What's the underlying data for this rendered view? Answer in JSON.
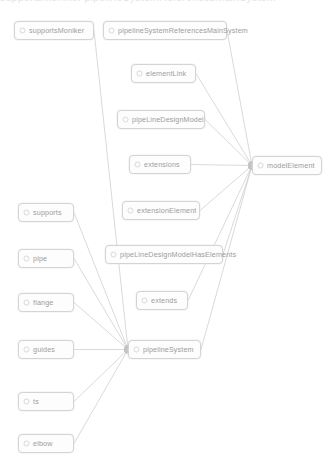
{
  "diagram": {
    "title_partial": "supportsMoniker  pipelineSystemReferencesMainSystem",
    "icon_name": "class-node-icon",
    "edge_color": "#b9b9b9",
    "node_border_color": "#c9c9c9",
    "node_fill_color": "#fdfdfd",
    "label_color": "#7a7a7a",
    "background_color": "#ffffff",
    "nodes": [
      {
        "id": "supportsMoniker",
        "label": "supportsMoniker",
        "x": 14,
        "y": 21,
        "w": 80
      },
      {
        "id": "pipelineSystemReferencesMainSystem",
        "label": "pipelineSystemReferencesMainSystem",
        "x": 103,
        "y": 21,
        "w": 124
      },
      {
        "id": "elementLink",
        "label": "elementLink",
        "x": 131,
        "y": 64,
        "w": 65
      },
      {
        "id": "pipeLineDesignModel",
        "label": "pipeLineDesignModel",
        "x": 117,
        "y": 110,
        "w": 88
      },
      {
        "id": "extensions",
        "label": "extensions",
        "x": 129,
        "y": 155,
        "w": 62
      },
      {
        "id": "modelElement",
        "label": "modelElement",
        "x": 252,
        "y": 156,
        "w": 70
      },
      {
        "id": "extensionElement",
        "label": "extensionElement",
        "x": 122,
        "y": 201,
        "w": 78
      },
      {
        "id": "pipeLineDesignModelHasElements",
        "label": "pipeLineDesignModelHasElements",
        "x": 105,
        "y": 245,
        "w": 118
      },
      {
        "id": "extends",
        "label": "extends",
        "x": 136,
        "y": 291,
        "w": 52
      },
      {
        "id": "supports",
        "label": "supports",
        "x": 18,
        "y": 203,
        "w": 56
      },
      {
        "id": "pipe",
        "label": "pipe",
        "x": 18,
        "y": 249,
        "w": 56
      },
      {
        "id": "flange",
        "label": "flange",
        "x": 18,
        "y": 293,
        "w": 56
      },
      {
        "id": "guides",
        "label": "guides",
        "x": 18,
        "y": 340,
        "w": 56
      },
      {
        "id": "ts",
        "label": "ts",
        "x": 18,
        "y": 392,
        "w": 56
      },
      {
        "id": "elbow",
        "label": "elbow",
        "x": 18,
        "y": 434,
        "w": 56
      },
      {
        "id": "pipelineSystem",
        "label": "pipelineSystem",
        "x": 128,
        "y": 340,
        "w": 73
      }
    ],
    "edges": [
      {
        "from": "pipelineSystemReferencesMainSystem",
        "to": "modelElement"
      },
      {
        "from": "elementLink",
        "to": "modelElement"
      },
      {
        "from": "pipeLineDesignModel",
        "to": "modelElement"
      },
      {
        "from": "extensions",
        "to": "modelElement"
      },
      {
        "from": "extensionElement",
        "to": "modelElement"
      },
      {
        "from": "pipeLineDesignModelHasElements",
        "to": "modelElement"
      },
      {
        "from": "extends",
        "to": "modelElement"
      },
      {
        "from": "pipelineSystem",
        "to": "modelElement"
      },
      {
        "from": "supports",
        "to": "pipelineSystem"
      },
      {
        "from": "pipe",
        "to": "pipelineSystem"
      },
      {
        "from": "flange",
        "to": "pipelineSystem"
      },
      {
        "from": "guides",
        "to": "pipelineSystem"
      },
      {
        "from": "ts",
        "to": "pipelineSystem"
      },
      {
        "from": "elbow",
        "to": "pipelineSystem"
      },
      {
        "from": "supportsMoniker",
        "to": "pipelineSystem"
      }
    ]
  }
}
